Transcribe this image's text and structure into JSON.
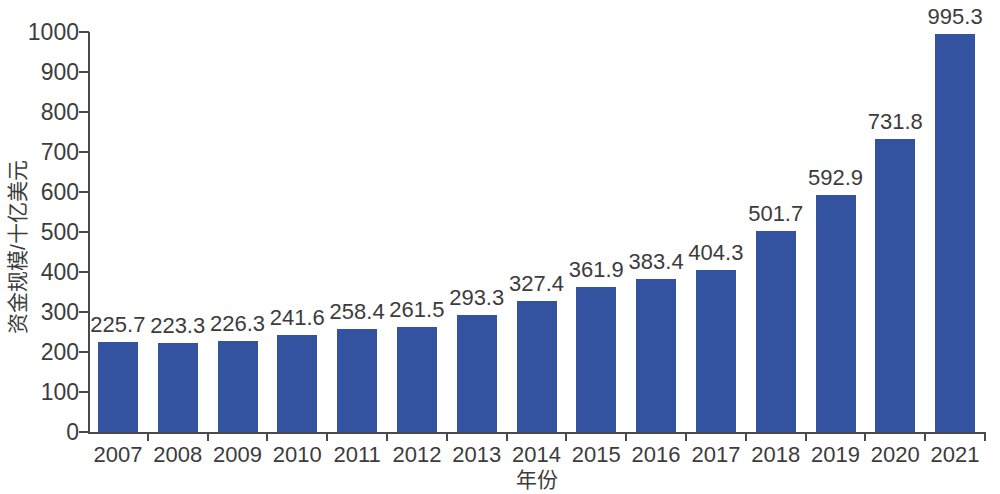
{
  "chart_data": {
    "type": "bar",
    "title": "",
    "subtitle": "",
    "xlabel": "年份",
    "ylabel": "资金规模/十亿美元",
    "categories": [
      "2007",
      "2008",
      "2009",
      "2010",
      "2011",
      "2012",
      "2013",
      "2014",
      "2015",
      "2016",
      "2017",
      "2018",
      "2019",
      "2020",
      "2021"
    ],
    "values": [
      225.7,
      223.3,
      226.3,
      241.6,
      258.4,
      261.5,
      293.3,
      327.4,
      361.9,
      383.4,
      404.3,
      501.7,
      592.9,
      731.8,
      995.3
    ],
    "value_labels": [
      "225.7",
      "223.3",
      "226.3",
      "241.6",
      "258.4",
      "261.5",
      "293.3",
      "327.4",
      "361.9",
      "383.4",
      "404.3",
      "501.7",
      "592.9",
      "731.8",
      "995.3"
    ],
    "ylim": [
      0,
      1000
    ],
    "yticks": [
      0,
      100,
      200,
      300,
      400,
      500,
      600,
      700,
      800,
      900,
      1000
    ],
    "ytick_labels": [
      "0",
      "100",
      "200",
      "300",
      "400",
      "500",
      "600",
      "700",
      "800",
      "900",
      "1000"
    ],
    "grid": false,
    "legend": null,
    "legend_position": "none",
    "series_color": "#33529f",
    "axis_color": "#4a4a4a",
    "text_color": "#3c3c3c",
    "background_color": "#ffffff"
  }
}
